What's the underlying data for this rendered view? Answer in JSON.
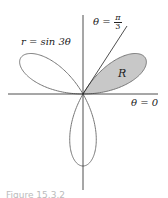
{
  "figure": {
    "curve_label": "r = sin 3θ",
    "ray_label_prefix": "θ =",
    "ray_frac_num": "π",
    "ray_frac_den": "3",
    "axis_label": "θ = 0",
    "region_label": "R",
    "caption": "Figure 15.3.2"
  },
  "colors": {
    "curve": "#777777",
    "region_fill": "#c8c8c8",
    "axes": "#222222"
  }
}
